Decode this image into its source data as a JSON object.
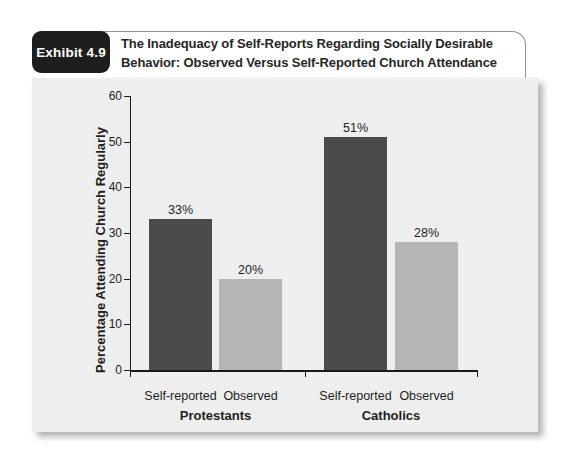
{
  "header": {
    "badge_label": "Exhibit 4.9",
    "title_line1": "The Inadequacy of Self-Reports Regarding Socially Desirable",
    "title_line2": "Behavior: Observed Versus Self-Reported Church Attendance"
  },
  "colors": {
    "badge_bg": "#1e1e1e",
    "badge_text": "#ffffff",
    "title_text": "#262626",
    "header_border": "#909090",
    "panel_bg": "#eeeeee",
    "dark_bar": "#4a4a4a",
    "light_bar": "#b5b5b5",
    "axis": "#1a1a1a",
    "text": "#1f1f1f"
  },
  "chart_data": {
    "type": "bar",
    "title": "The Inadequacy of Self-Reports Regarding Socially Desirable Behavior: Observed Versus Self-Reported Church Attendance",
    "xlabel": "",
    "ylabel": "Percentage Attending Church Regularly",
    "ylim": [
      0,
      60
    ],
    "yticks": [
      0,
      10,
      20,
      30,
      40,
      50,
      60
    ],
    "value_suffix": "%",
    "grid": false,
    "legend": false,
    "groups": [
      {
        "label": "Protestants",
        "bars": [
          {
            "label": "Self-reported",
            "value": 33,
            "color_key": "dark_bar"
          },
          {
            "label": "Observed",
            "value": 20,
            "color_key": "light_bar"
          }
        ]
      },
      {
        "label": "Catholics",
        "bars": [
          {
            "label": "Self-reported",
            "value": 51,
            "color_key": "dark_bar"
          },
          {
            "label": "Observed",
            "value": 28,
            "color_key": "light_bar"
          }
        ]
      }
    ]
  }
}
